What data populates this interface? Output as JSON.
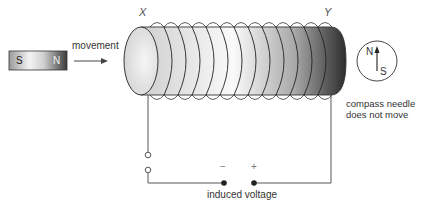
{
  "diagram": {
    "magnet": {
      "south_label": "S",
      "north_label": "N"
    },
    "movement_label": "movement",
    "coil_end_labels": {
      "left": "X",
      "right": "Y"
    },
    "compass": {
      "north_label": "N",
      "south_label": "S",
      "caption_line1": "compass needle",
      "caption_line2": "does not move"
    },
    "terminals": {
      "negative": "−",
      "positive": "+"
    },
    "voltage_label": "induced voltage",
    "coil_turns": 13
  }
}
